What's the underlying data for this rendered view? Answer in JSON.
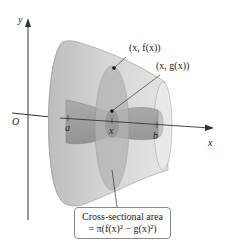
{
  "diagram": {
    "axes": {
      "y_label": "y",
      "x_label": "x",
      "origin_label": "O"
    },
    "points": {
      "outer_point_label": "(x, f(x))",
      "inner_point_label": "(x, g(x))"
    },
    "ticks": {
      "a_label": "a",
      "x_label": "x",
      "b_label": "b"
    },
    "callout": {
      "line1": "Cross-sectional area",
      "line2": "= π(f(x)² − g(x)²)"
    },
    "colors": {
      "solid_outer": "#c8c8c8",
      "solid_inner": "#9a9a9a",
      "cross_section": "#b0b0b0",
      "axis": "#333333"
    }
  }
}
